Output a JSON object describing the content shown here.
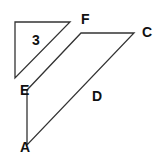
{
  "diagram": {
    "type": "geometry",
    "colors": {
      "stroke": "#333333",
      "label": "#111111",
      "background": "#ffffff"
    },
    "triangle": {
      "label": "3",
      "points": [
        [
          15,
          22
        ],
        [
          70,
          22
        ],
        [
          15,
          78
        ]
      ],
      "label_pos": [
        32,
        45
      ]
    },
    "quadrilateral": {
      "points": [
        [
          27,
          90
        ],
        [
          81,
          33
        ],
        [
          134,
          33
        ],
        [
          27,
          145
        ]
      ],
      "vertices": [
        {
          "name": "F",
          "label": "F",
          "pos": [
            81,
            24
          ]
        },
        {
          "name": "C",
          "label": "C",
          "pos": [
            142,
            37
          ]
        },
        {
          "name": "E",
          "label": "E",
          "pos": [
            20,
            95
          ]
        },
        {
          "name": "A",
          "label": "A",
          "pos": [
            20,
            152
          ]
        }
      ],
      "side_label": {
        "label": "D",
        "pos": [
          92,
          101
        ]
      }
    }
  }
}
